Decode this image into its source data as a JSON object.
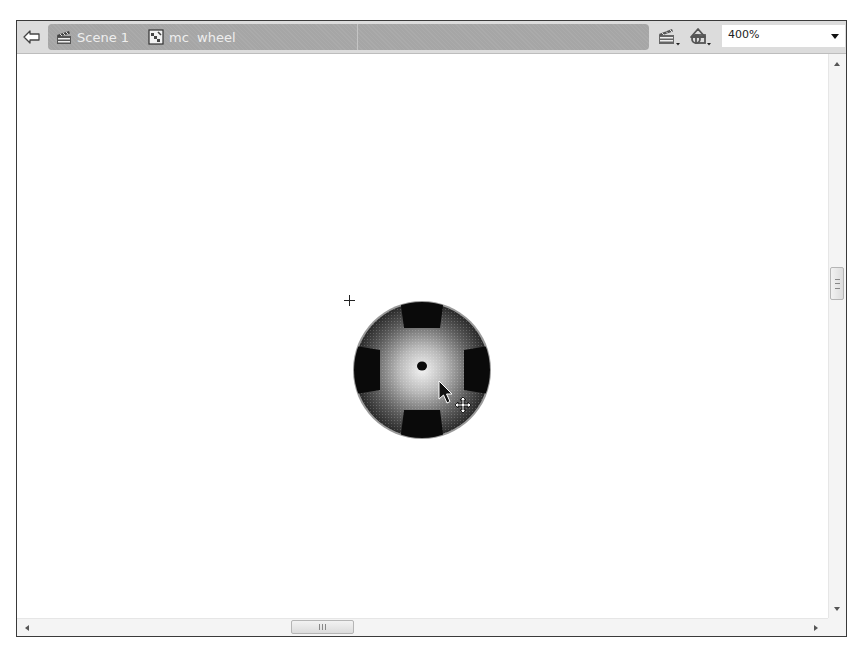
{
  "header": {
    "back_button": {
      "icon": "back-arrow-icon",
      "label": "Back"
    },
    "breadcrumbs": [
      {
        "label": "Scene 1",
        "icon": "scene-clapperboard-icon"
      },
      {
        "label": "mc  wheel",
        "icon": "movieclip-symbol-icon"
      }
    ],
    "tools": [
      {
        "name": "edit-scene",
        "icon": "clapperboard-dropdown-icon"
      },
      {
        "name": "edit-symbols",
        "icon": "symbols-dropdown-icon"
      }
    ],
    "zoom": {
      "value": "400%",
      "icon": "chevron-down-icon"
    }
  },
  "stage": {
    "object": "wheel movie clip instance",
    "registration_point": "crosshair",
    "cursor": "move-arrow-cursor",
    "colors": {
      "wheel_center": "#d8d8d8",
      "wheel_edge": "#3a3a3a",
      "spokes": "#0a0a0a",
      "rim": "#9a9a9a"
    }
  },
  "scrollbars": {
    "vertical": {
      "thumb_grip": "≡"
    },
    "horizontal": {
      "thumb_grip": "|||"
    }
  },
  "colors": {
    "header_bg": "#dcdcdc",
    "breadcrumb_bg": "#a6a6a6",
    "breadcrumb_text": "#eeeeee",
    "frame_border": "#3a3a3a"
  }
}
